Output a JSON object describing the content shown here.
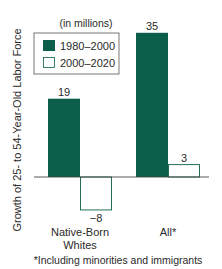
{
  "chart_data": {
    "type": "bar",
    "title": "",
    "unit_note": "(in millions)",
    "ylabel": "Growth of 25- to 54-Year-Old Labor Force",
    "xlabel": "",
    "categories": [
      "Native-Born Whites",
      "All*"
    ],
    "category_lines": [
      [
        "Native-Born",
        "Whites"
      ],
      [
        "All*"
      ]
    ],
    "series": [
      {
        "name": "1980–2000",
        "values": [
          19,
          35
        ],
        "color": "#0b5e49",
        "filled": true
      },
      {
        "name": "2000–2020",
        "values": [
          -8,
          3
        ],
        "color": "#0b5e49",
        "filled": false
      }
    ],
    "data_labels": [
      [
        "19",
        "35"
      ],
      [
        "−8",
        "3"
      ]
    ],
    "ylim": [
      -8,
      35
    ],
    "grid": false,
    "legend_position": "top-left",
    "footnote": "*Including minorities and immigrants"
  }
}
